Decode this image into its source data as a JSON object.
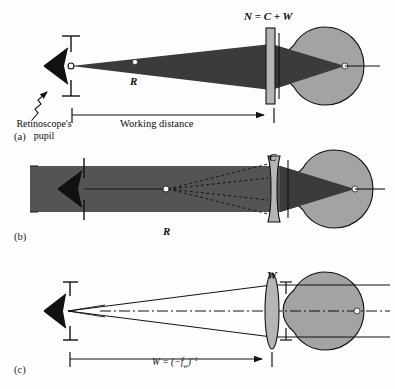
{
  "figure": {
    "background_color": "#fefefe",
    "ink_color": "#111111",
    "eye_fill_color": "#a3a3a3",
    "beam_fill_color": "#3b3b3b",
    "band_fill_color": "#545454",
    "lens_fill_color": "#b5b5b5"
  },
  "panels": [
    {
      "letter": "(a)",
      "labels": {
        "lens_top": "N = C + W",
        "ray_point": "R",
        "source_caption_line1": "Retinoscope's",
        "source_caption_line2": "pupil",
        "dimension": "Working distance"
      }
    },
    {
      "letter": "(b)",
      "labels": {
        "lens_top": "C",
        "ray_point": "R"
      }
    },
    {
      "letter": "(c)",
      "labels": {
        "lens_top": "W",
        "dimension_prefix": "W = (−f",
        "dimension_sub": "w",
        "dimension_suffix": ")",
        "dimension_exp": "−1",
        "dimension_full": "W = (−f w )−1"
      }
    }
  ]
}
